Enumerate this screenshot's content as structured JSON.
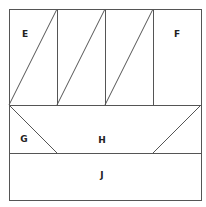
{
  "diagram": {
    "stroke_color": "#555555",
    "regions": [
      {
        "id": "E",
        "label": "E",
        "x": 25,
        "y": 37
      },
      {
        "id": "F",
        "label": "F",
        "x": 177,
        "y": 37
      },
      {
        "id": "G",
        "label": "G",
        "x": 24,
        "y": 142
      },
      {
        "id": "H",
        "label": "H",
        "x": 102,
        "y": 143
      },
      {
        "id": "J",
        "label": "J",
        "x": 102,
        "y": 178
      }
    ]
  }
}
